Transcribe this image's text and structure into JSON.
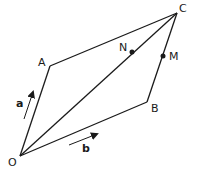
{
  "diagram": {
    "type": "parallelogram-vectors",
    "points": {
      "O": {
        "label": "O",
        "x": 20,
        "y": 156
      },
      "A": {
        "label": "A",
        "x": 50,
        "y": 66
      },
      "C": {
        "label": "C",
        "x": 177,
        "y": 13
      },
      "B": {
        "label": "B",
        "x": 147,
        "y": 102
      },
      "N": {
        "label": "N",
        "x": 132,
        "y": 52
      },
      "M": {
        "label": "M",
        "x": 163,
        "y": 56
      }
    },
    "vectors": {
      "a": {
        "label": "a"
      },
      "b": {
        "label": "b"
      }
    },
    "edges": [
      "OA",
      "AC",
      "CB",
      "BO",
      "OC"
    ],
    "colors": {
      "line": "#1a1a1a",
      "background": "#ffffff"
    }
  }
}
